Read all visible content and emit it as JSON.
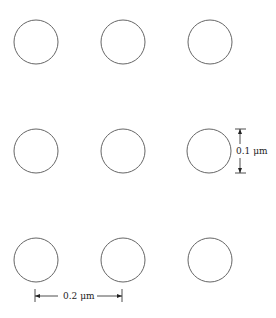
{
  "diagram": {
    "grid": {
      "rows": 3,
      "cols": 3,
      "col_centers": [
        36,
        123,
        210
      ],
      "row_centers": [
        42,
        151,
        260
      ],
      "radius": 22,
      "stroke_color": "#666666"
    },
    "dimensions": {
      "diameter": {
        "label": "0.1 μm",
        "orientation": "vertical"
      },
      "spacing": {
        "label": "0.2 μm",
        "orientation": "horizontal"
      }
    }
  }
}
